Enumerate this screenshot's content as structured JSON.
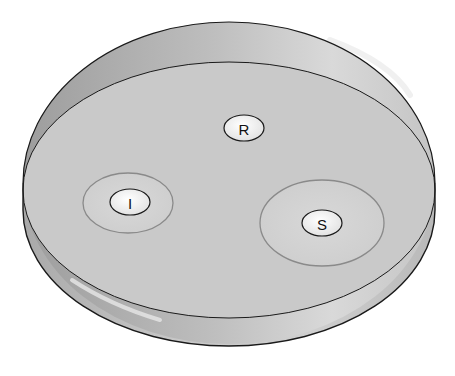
{
  "figure": {
    "disks": [
      {
        "label": "R",
        "meaning_position": "center-top",
        "zone": "none"
      },
      {
        "label": "I",
        "meaning_position": "left",
        "zone": "small"
      },
      {
        "label": "S",
        "meaning_position": "right",
        "zone": "large"
      }
    ],
    "colors": {
      "background": "#ffffff",
      "agar": "#c9c9c9",
      "rim_inner_wall": "#b4b4b4",
      "rim_highlight": "#e6e6e6",
      "side_wall": "#c2c2c2",
      "outline": "#1a1a1a",
      "zone_ring": "#8a8a8a",
      "zone_fill": "#d2d2d2",
      "disk_fill": "#f4f4f4"
    }
  }
}
